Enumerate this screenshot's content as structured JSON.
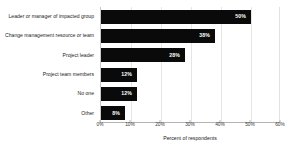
{
  "chart_data": {
    "type": "bar",
    "orientation": "horizontal",
    "title": "",
    "subtitle": "",
    "xlabel": "Percent of respondents",
    "ylabel": "",
    "categories": [
      "Leader or manager of impacted group",
      "Change management resource or team",
      "Project leader",
      "Project team members",
      "No one",
      "Other"
    ],
    "values": [
      50,
      38,
      28,
      12,
      12,
      8
    ],
    "data_labels": [
      "50%",
      "38%",
      "28%",
      "12%",
      "12%",
      "8%"
    ],
    "xlim": [
      0,
      60
    ],
    "xtick_labels": [
      "0%",
      "10%",
      "20%",
      "30%",
      "40%",
      "50%",
      "60%"
    ],
    "xtick_values": [
      0,
      10,
      20,
      30,
      40,
      50,
      60
    ],
    "grid": true,
    "legend": "none",
    "bar_color": "#0a0a0a",
    "data_label_color": "#ffffff",
    "grid_color": "#e6e6e6",
    "axis_color": "#b4b4b4",
    "background_color": "#ffffff"
  }
}
